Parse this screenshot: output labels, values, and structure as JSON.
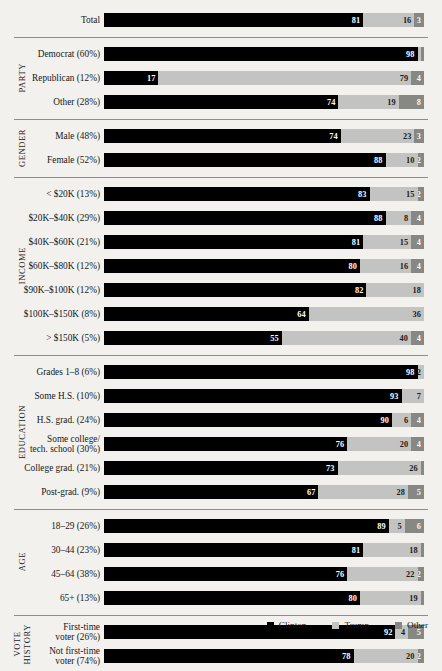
{
  "chart_data": {
    "type": "bar",
    "subtype": "stacked-horizontal-100",
    "title": "",
    "xlabel": "",
    "ylabel": "",
    "xlim": [
      0,
      100
    ],
    "grid": false,
    "legend_position": "bottom-right",
    "series": [
      {
        "name": "Clinton",
        "key": "clinton",
        "color": "#000000"
      },
      {
        "name": "Trump",
        "key": "trump",
        "color": "#c3c3c1"
      },
      {
        "name": "Other",
        "key": "other",
        "color": "#878783"
      }
    ],
    "groups": [
      {
        "axis_label": "",
        "rule_above": false,
        "rows": [
          {
            "label": "Total",
            "values": [
              81,
              16,
              3
            ],
            "show": [
              true,
              true,
              true
            ]
          }
        ]
      },
      {
        "axis_label": "PARTY",
        "rule_above": true,
        "rows": [
          {
            "label": "Democrat (60%)",
            "values": [
              98,
              1,
              1
            ],
            "show": [
              true,
              true,
              false
            ]
          },
          {
            "label": "Republican (12%)",
            "values": [
              17,
              79,
              4
            ],
            "show": [
              true,
              true,
              true
            ]
          },
          {
            "label": "Other (28%)",
            "values": [
              74,
              19,
              8
            ],
            "show": [
              true,
              true,
              true
            ]
          }
        ]
      },
      {
        "axis_label": "GENDER",
        "rule_above": true,
        "rows": [
          {
            "label": "Male (48%)",
            "values": [
              74,
              23,
              3
            ],
            "show": [
              true,
              true,
              true
            ]
          },
          {
            "label": "Female (52%)",
            "values": [
              88,
              10,
              2
            ],
            "show": [
              true,
              true,
              true
            ]
          }
        ]
      },
      {
        "axis_label": "INCOME",
        "rule_above": true,
        "rows": [
          {
            "label": "< $20K (13%)",
            "values": [
              83,
              15,
              2
            ],
            "show": [
              true,
              true,
              true
            ]
          },
          {
            "label": "$20K–$40K (29%)",
            "values": [
              88,
              8,
              4
            ],
            "show": [
              true,
              true,
              true
            ]
          },
          {
            "label": "$40K–$60K (21%)",
            "values": [
              81,
              15,
              4
            ],
            "show": [
              true,
              true,
              true
            ]
          },
          {
            "label": "$60K–$80K (12%)",
            "values": [
              80,
              16,
              4
            ],
            "show": [
              true,
              true,
              true
            ]
          },
          {
            "label": "$90K–$100K (12%)",
            "values": [
              82,
              18,
              0
            ],
            "show": [
              true,
              true,
              false
            ]
          },
          {
            "label": "$100K–$150K (8%)",
            "values": [
              64,
              36,
              0
            ],
            "show": [
              true,
              true,
              false
            ]
          },
          {
            "label": "> $150K (5%)",
            "values": [
              55,
              40,
              4
            ],
            "show": [
              true,
              true,
              true
            ]
          }
        ]
      },
      {
        "axis_label": "EDUCATION",
        "rule_above": true,
        "rows": [
          {
            "label": "Grades 1–8 (6%)",
            "values": [
              98,
              2,
              0
            ],
            "show": [
              true,
              true,
              false
            ]
          },
          {
            "label": "Some H.S. (10%)",
            "values": [
              93,
              7,
              0
            ],
            "show": [
              true,
              true,
              false
            ]
          },
          {
            "label": "H.S. grad. (24%)",
            "values": [
              90,
              6,
              4
            ],
            "show": [
              true,
              true,
              true
            ]
          },
          {
            "label": "Some college/\ntech. school (30%)",
            "values": [
              76,
              20,
              4
            ],
            "show": [
              true,
              true,
              true
            ]
          },
          {
            "label": "College grad. (21%)",
            "values": [
              73,
              26,
              1
            ],
            "show": [
              true,
              true,
              false
            ]
          },
          {
            "label": "Post-grad. (9%)",
            "values": [
              67,
              28,
              5
            ],
            "show": [
              true,
              true,
              true
            ]
          }
        ]
      },
      {
        "axis_label": "AGE",
        "rule_above": true,
        "rows": [
          {
            "label": "18–29 (26%)",
            "values": [
              89,
              5,
              6
            ],
            "show": [
              true,
              true,
              true
            ]
          },
          {
            "label": "30–44 (23%)",
            "values": [
              81,
              18,
              1
            ],
            "show": [
              true,
              true,
              false
            ]
          },
          {
            "label": "45–64 (38%)",
            "values": [
              76,
              22,
              2
            ],
            "show": [
              true,
              true,
              true
            ]
          },
          {
            "label": "65+ (13%)",
            "values": [
              80,
              19,
              1
            ],
            "show": [
              true,
              true,
              false
            ]
          }
        ]
      },
      {
        "axis_label": "VOTE\nHISTORY",
        "rule_above": true,
        "rows": [
          {
            "label": "First-time\nvoter (26%)",
            "values": [
              92,
              4,
              5
            ],
            "show": [
              true,
              true,
              true
            ]
          },
          {
            "label": "Not first-time\nvoter (74%)",
            "values": [
              78,
              20,
              2
            ],
            "show": [
              true,
              true,
              true
            ]
          }
        ]
      }
    ]
  },
  "legend": {
    "items": [
      {
        "label": "Clinton",
        "color": "#000000",
        "icon": "legend-swatch-clinton"
      },
      {
        "label": "Trump",
        "color": "#c3c3c1",
        "icon": "legend-swatch-trump"
      },
      {
        "label": "Other",
        "color": "#878783",
        "icon": "legend-swatch-other"
      }
    ]
  }
}
